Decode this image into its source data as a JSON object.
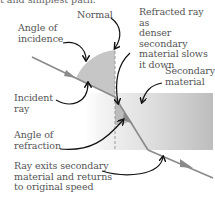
{
  "header": {
    "text": "t and simplest path."
  },
  "labels": {
    "normal": "Normal",
    "refracted_ray": "Refracted ray as\ndenser secondary\nmaterial slows\nit down",
    "angle_incidence": "Angle of\nincidence",
    "secondary_material": "Secondary\nmaterial",
    "incident_ray": "Incident\nray",
    "angle_refraction": "Angle of\nrefraction",
    "ray_exits": "Ray exits secondary\nmaterial and returns\nto original speed"
  },
  "colors": {
    "ray": "#8a8a8a",
    "material_light": "#f4f4f4",
    "material_dark": "#b8b8b8",
    "angle_wedge": "#c4c4c4",
    "arrow": "#111111",
    "text": "#555555"
  }
}
